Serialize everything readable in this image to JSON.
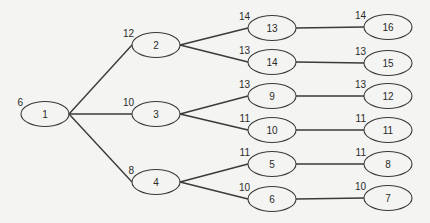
{
  "diagram": {
    "type": "tree",
    "colors": {
      "background": "#f4f4f2",
      "stroke": "#3a3a3a",
      "text": "#2a2a2a"
    },
    "nodes": [
      {
        "id": "1",
        "label": "1",
        "weight": "6",
        "cx": 45,
        "cy": 114
      },
      {
        "id": "2",
        "label": "2",
        "weight": "12",
        "cx": 156,
        "cy": 45
      },
      {
        "id": "3",
        "label": "3",
        "weight": "10",
        "cx": 156,
        "cy": 114
      },
      {
        "id": "4",
        "label": "4",
        "weight": "8",
        "cx": 156,
        "cy": 182
      },
      {
        "id": "13",
        "label": "13",
        "weight": "14",
        "cx": 272,
        "cy": 28
      },
      {
        "id": "14",
        "label": "14",
        "weight": "13",
        "cx": 272,
        "cy": 62
      },
      {
        "id": "9",
        "label": "9",
        "weight": "13",
        "cx": 272,
        "cy": 96
      },
      {
        "id": "10",
        "label": "10",
        "weight": "11",
        "cx": 272,
        "cy": 130
      },
      {
        "id": "5",
        "label": "5",
        "weight": "11",
        "cx": 272,
        "cy": 164
      },
      {
        "id": "6",
        "label": "6",
        "weight": "10",
        "cx": 272,
        "cy": 199
      },
      {
        "id": "16",
        "label": "16",
        "weight": "14",
        "cx": 388,
        "cy": 27
      },
      {
        "id": "15",
        "label": "15",
        "weight": "13",
        "cx": 388,
        "cy": 63
      },
      {
        "id": "12",
        "label": "12",
        "weight": "13",
        "cx": 388,
        "cy": 96
      },
      {
        "id": "11",
        "label": "11",
        "weight": "11",
        "cx": 388,
        "cy": 130
      },
      {
        "id": "8",
        "label": "8",
        "weight": "11",
        "cx": 388,
        "cy": 164
      },
      {
        "id": "7",
        "label": "7",
        "weight": "10",
        "cx": 388,
        "cy": 198
      }
    ],
    "edges": [
      {
        "from": "1",
        "to": "2"
      },
      {
        "from": "1",
        "to": "3"
      },
      {
        "from": "1",
        "to": "4"
      },
      {
        "from": "2",
        "to": "13"
      },
      {
        "from": "2",
        "to": "14"
      },
      {
        "from": "3",
        "to": "9"
      },
      {
        "from": "3",
        "to": "10"
      },
      {
        "from": "4",
        "to": "5"
      },
      {
        "from": "4",
        "to": "6"
      },
      {
        "from": "13",
        "to": "16"
      },
      {
        "from": "14",
        "to": "15"
      },
      {
        "from": "9",
        "to": "12"
      },
      {
        "from": "10",
        "to": "11"
      },
      {
        "from": "5",
        "to": "8"
      },
      {
        "from": "6",
        "to": "7"
      }
    ]
  }
}
